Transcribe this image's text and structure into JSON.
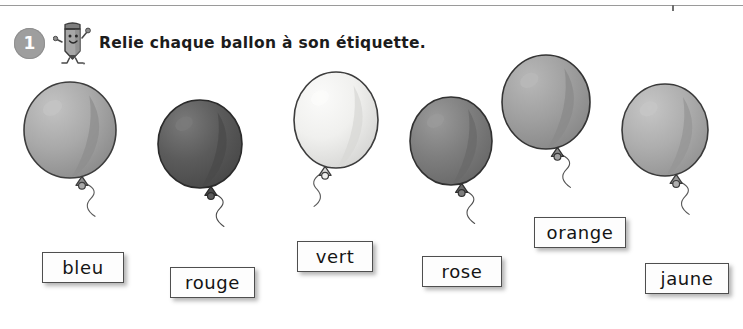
{
  "page": {
    "width": 743,
    "height": 329,
    "background": "#ffffff",
    "rule_color": "#9a9a9a"
  },
  "exercise": {
    "number": "1",
    "number_badge_color": "#9e9e9e",
    "mascot_icon": "pencil-mascot-icon",
    "instruction": "Relie chaque ballon à son étiquette."
  },
  "balloons": [
    {
      "id": "balloon-bleu",
      "color_name": "bleu",
      "fill": "#a9a9a9",
      "shade": "#8e8e8e",
      "highlight": "#c3c3c3",
      "outline": "#3d3d3d",
      "x": 22,
      "y": 78,
      "w": 96,
      "h": 100,
      "string_side": "right"
    },
    {
      "id": "balloon-rouge",
      "color_name": "rouge",
      "fill": "#5b5b5b",
      "shade": "#4a4a4a",
      "highlight": "#7a7a7a",
      "outline": "#2b2b2b",
      "x": 156,
      "y": 96,
      "w": 88,
      "h": 92,
      "string_side": "right"
    },
    {
      "id": "balloon-vert",
      "color_name": "vert",
      "fill": "#f0f0ee",
      "shade": "#d8d8d6",
      "highlight": "#fbfbfa",
      "outline": "#3d3d3d",
      "x": 292,
      "y": 68,
      "w": 88,
      "h": 100,
      "string_side": "left"
    },
    {
      "id": "balloon-rose",
      "color_name": "rose",
      "fill": "#7e7e7e",
      "shade": "#6a6a6a",
      "highlight": "#9a9a9a",
      "outline": "#313131",
      "x": 408,
      "y": 93,
      "w": 86,
      "h": 92,
      "string_side": "right"
    },
    {
      "id": "balloon-orange",
      "color_name": "orange",
      "fill": "#a0a0a0",
      "shade": "#8a8a8a",
      "highlight": "#b8b8b8",
      "outline": "#343434",
      "x": 500,
      "y": 51,
      "w": 92,
      "h": 98,
      "string_side": "right"
    },
    {
      "id": "balloon-jaune",
      "color_name": "jaune",
      "fill": "#aeaeae",
      "shade": "#969696",
      "highlight": "#c6c6c6",
      "outline": "#3a3a3a",
      "x": 620,
      "y": 80,
      "w": 90,
      "h": 96,
      "string_side": "right"
    }
  ],
  "labels": [
    {
      "id": "label-bleu",
      "text": "bleu",
      "x": 42,
      "y": 252,
      "w": 82,
      "h": 31
    },
    {
      "id": "label-rouge",
      "text": "rouge",
      "x": 170,
      "y": 267,
      "w": 85,
      "h": 31
    },
    {
      "id": "label-vert",
      "text": "vert",
      "x": 297,
      "y": 241,
      "w": 76,
      "h": 31
    },
    {
      "id": "label-rose",
      "text": "rose",
      "x": 422,
      "y": 256,
      "w": 80,
      "h": 31
    },
    {
      "id": "label-orange",
      "text": "orange",
      "x": 534,
      "y": 217,
      "w": 92,
      "h": 31
    },
    {
      "id": "label-jaune",
      "text": "jaune",
      "x": 645,
      "y": 263,
      "w": 84,
      "h": 31
    }
  ]
}
